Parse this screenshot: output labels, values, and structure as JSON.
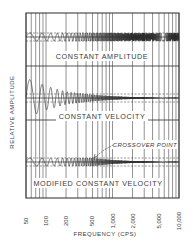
{
  "chart_data": {
    "type": "line",
    "title": "",
    "xlabel": "FREQUENCY (CPS)",
    "ylabel": "RELATIVE AMPLITUDE",
    "x_scale": "log",
    "xlim": [
      50,
      10000
    ],
    "x_ticks": [
      "50",
      "100",
      "200",
      "500",
      "1,000",
      "2,000",
      "5,000",
      "10,000"
    ],
    "x_tick_values": [
      50,
      100,
      200,
      500,
      1000,
      2000,
      5000,
      10000
    ],
    "grid": true,
    "legend": null,
    "panels": [
      {
        "name": "CONSTANT AMPLITUDE",
        "description": "Waveform whose amplitude stays constant across all frequencies",
        "amplitude_profile": [
          {
            "freq": 50,
            "amp": 1.0
          },
          {
            "freq": 10000,
            "amp": 1.0
          }
        ]
      },
      {
        "name": "CONSTANT VELOCITY",
        "description": "Waveform whose amplitude decreases inversely with frequency",
        "amplitude_profile": [
          {
            "freq": 50,
            "amp": 5.0
          },
          {
            "freq": 100,
            "amp": 3.0
          },
          {
            "freq": 200,
            "amp": 1.6
          },
          {
            "freq": 500,
            "amp": 0.8
          },
          {
            "freq": 1000,
            "amp": 0.45
          },
          {
            "freq": 2000,
            "amp": 0.25
          },
          {
            "freq": 5000,
            "amp": 0.1
          },
          {
            "freq": 10000,
            "amp": 0.05
          }
        ]
      },
      {
        "name": "MODIFIED CONSTANT VELOCITY",
        "description": "Constant amplitude below crossover, constant velocity above",
        "annotation": "CROSSOVER POINT",
        "crossover_freq": 500,
        "amplitude_profile": [
          {
            "freq": 50,
            "amp": 1.0
          },
          {
            "freq": 500,
            "amp": 1.0
          },
          {
            "freq": 1000,
            "amp": 0.5
          },
          {
            "freq": 2000,
            "amp": 0.25
          },
          {
            "freq": 5000,
            "amp": 0.1
          },
          {
            "freq": 10000,
            "amp": 0.05
          }
        ]
      }
    ]
  },
  "labels": {
    "panel1": "CONSTANT AMPLITUDE",
    "panel2": "CONSTANT VELOCITY",
    "panel3": "MODIFIED CONSTANT VELOCITY",
    "annotation": "CROSSOVER POINT",
    "xlabel": "FREQUENCY (CPS)",
    "ylabel": "RELATIVE AMPLITUDE",
    "ticks": [
      "50",
      "100",
      "200",
      "500",
      "1,000",
      "2,000",
      "5,000",
      "10,000"
    ]
  },
  "colors": {
    "ink": "#2b2b2b",
    "grid": "#4a4a4a",
    "background": "#ffffff"
  }
}
